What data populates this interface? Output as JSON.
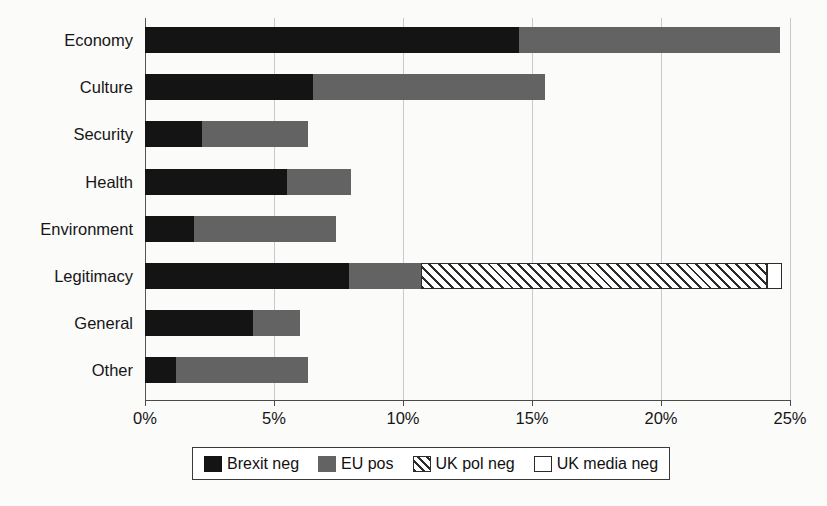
{
  "chart_data": {
    "type": "bar",
    "orientation": "horizontal",
    "stacked": true,
    "title": "",
    "xlabel": "",
    "ylabel": "",
    "xlim": [
      0,
      25
    ],
    "xunit": "%",
    "xticks": [
      0,
      5,
      10,
      15,
      20,
      25
    ],
    "xtick_labels": [
      "0%",
      "5%",
      "10%",
      "15%",
      "20%",
      "25%"
    ],
    "grid": true,
    "grid_axis": "x",
    "legend_position": "bottom",
    "categories": [
      "Economy",
      "Culture",
      "Security",
      "Health",
      "Environment",
      "Legitimacy",
      "General",
      "Other"
    ],
    "series": [
      {
        "name": "Brexit neg",
        "color": "#141414",
        "fill": "solid",
        "values": [
          14.5,
          6.5,
          2.2,
          5.5,
          1.9,
          7.9,
          4.2,
          1.2
        ]
      },
      {
        "name": "EU pos",
        "color": "#636363",
        "fill": "solid",
        "values": [
          10.1,
          9.0,
          4.1,
          2.5,
          5.5,
          2.8,
          1.8,
          5.1
        ]
      },
      {
        "name": "UK pol neg",
        "color": "#2b2b2b",
        "fill": "diagonal-hatch",
        "values": [
          0,
          0,
          0,
          0,
          0,
          13.4,
          0,
          0
        ]
      },
      {
        "name": "UK media neg",
        "color": "#ffffff",
        "fill": "outline",
        "values": [
          0,
          0,
          0,
          0,
          0,
          0.6,
          0,
          0
        ]
      }
    ],
    "totals": [
      24.6,
      15.5,
      6.3,
      8.0,
      7.4,
      24.7,
      6.0,
      6.3
    ]
  },
  "legend": {
    "items": [
      {
        "label": "Brexit neg",
        "swatch": "sw-brexit-neg"
      },
      {
        "label": "EU pos",
        "swatch": "sw-eu-pos"
      },
      {
        "label": "UK pol neg",
        "swatch": "sw-uk-pol-neg"
      },
      {
        "label": "UK media neg",
        "swatch": "sw-uk-media-neg"
      }
    ]
  }
}
